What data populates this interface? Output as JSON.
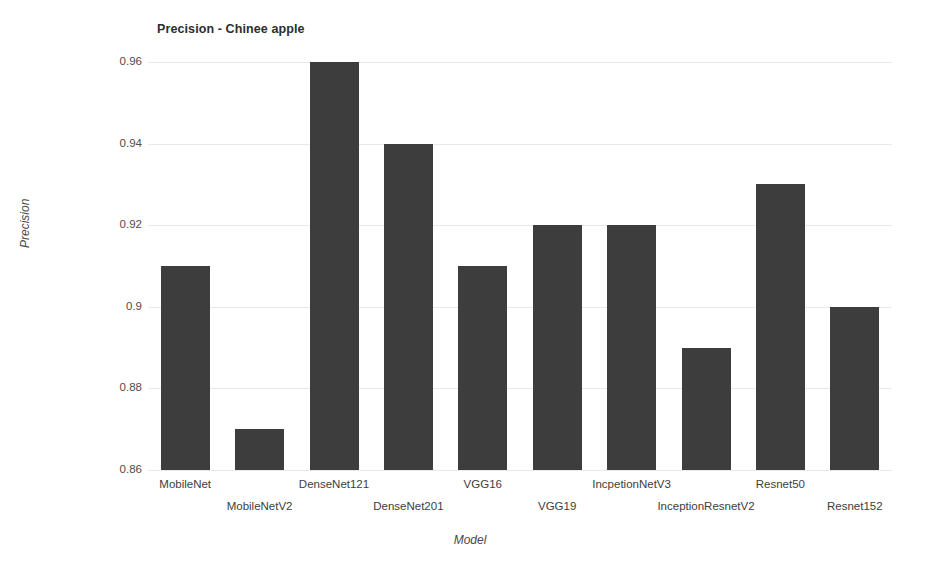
{
  "chart_data": {
    "type": "bar",
    "title": "Precision - Chinee apple",
    "xlabel": "Model",
    "ylabel": "Precision",
    "categories": [
      "MobileNet",
      "MobileNetV2",
      "DenseNet121",
      "DenseNet201",
      "VGG16",
      "VGG19",
      "IncpetionNetV3",
      "InceptionResnetV2",
      "Resnet50",
      "Resnet152"
    ],
    "values": [
      0.91,
      0.87,
      0.96,
      0.94,
      0.91,
      0.92,
      0.92,
      0.89,
      0.93,
      0.9
    ],
    "ylim": [
      0.86,
      0.96
    ],
    "yticks": [
      0.86,
      0.88,
      0.9,
      0.92,
      0.94,
      0.96
    ],
    "ytick_labels": [
      "0.86",
      "0.88",
      "0.9",
      "0.92",
      "0.94",
      "0.96"
    ],
    "grid": true,
    "legend": "none",
    "bar_color": "#3d3d3d",
    "grid_color": "#e9e9e9",
    "background_color": "#ffffff"
  }
}
